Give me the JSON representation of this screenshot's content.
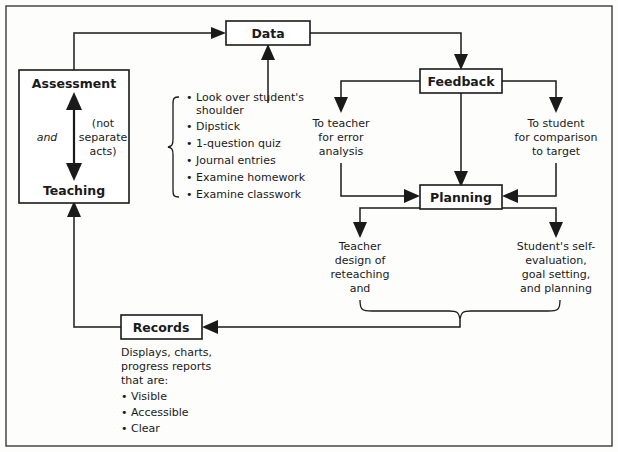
{
  "diagram": {
    "colors": {
      "line": "#1a1a1a",
      "frame": "#3a3a3a",
      "box_fill": "#ffffff",
      "background": "#fdfdfb"
    },
    "nodes": {
      "data": "Data",
      "feedback": "Feedback",
      "planning": "Planning",
      "records": "Records",
      "assessment": "Assessment",
      "teaching": "Teaching"
    },
    "assessment_box": {
      "top_label": "Assessment",
      "bottom_label": "Teaching",
      "left_word": "and",
      "right_note_lines": [
        "(not",
        "separate",
        "acts)"
      ]
    },
    "methods_list": {
      "items": [
        "Look over student's",
        "shoulder",
        "Dipstick",
        "1-question quiz",
        "Journal entries",
        "Examine homework",
        "Examine classwork"
      ],
      "bullet": "•"
    },
    "feedback_branches": {
      "left_lines": [
        "To teacher",
        "for error",
        "analysis"
      ],
      "right_lines": [
        "To student",
        "for comparison",
        "to target"
      ]
    },
    "planning_branches": {
      "left_lines": [
        "Teacher",
        "design of",
        "reteaching",
        "and"
      ],
      "right_lines": [
        "Student's self-",
        "evaluation,",
        "goal setting,",
        "and planning"
      ]
    },
    "records_caption": {
      "lines": [
        "Displays, charts,",
        "progress reports",
        "that are:"
      ],
      "bullets": [
        "Visible",
        "Accessible",
        "Clear"
      ],
      "bullet": "•"
    }
  }
}
